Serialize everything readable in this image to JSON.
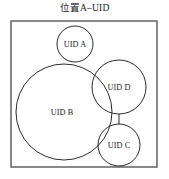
{
  "figure": {
    "title": "位置A–UID",
    "boundary": {
      "name": "位置A",
      "x": 11,
      "y": 21,
      "width": 146,
      "height": 146
    },
    "nodes": [
      {
        "id": "A",
        "label": "UID A",
        "cx": 75,
        "cy": 44,
        "r": 18
      },
      {
        "id": "B",
        "label": "UID B",
        "cx": 64,
        "cy": 112,
        "r": 48
      },
      {
        "id": "D",
        "label": "UID D",
        "cx": 119,
        "cy": 87,
        "r": 27
      },
      {
        "id": "C",
        "label": "UID C",
        "cx": 119,
        "cy": 145,
        "r": 21
      }
    ],
    "connectors": [
      {
        "from": "D",
        "to": "C",
        "x1": 119,
        "y1": 114,
        "x2": 119,
        "y2": 124
      }
    ],
    "colors": {
      "stroke": "#2b2b2b",
      "boundary_stroke": "#4a4a4a",
      "background": "#ffffff",
      "text": "#1a1a1a"
    }
  }
}
